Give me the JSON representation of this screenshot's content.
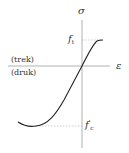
{
  "diagram": {
    "type": "stress-strain curve (concrete)",
    "axes": {
      "y_label": "σ",
      "x_label": "ε"
    },
    "region_labels": {
      "tension": "(trek)",
      "compression": "(druk)"
    },
    "markers": {
      "tensile_strength": {
        "symbol": "f",
        "subscript": "t"
      },
      "compressive_strength": {
        "symbol": "f",
        "prime": "′",
        "subscript": "c"
      }
    },
    "colors": {
      "axis": "#999999",
      "curve": "#222222",
      "dashed": "#aaaaaa",
      "text": "#333333"
    }
  }
}
